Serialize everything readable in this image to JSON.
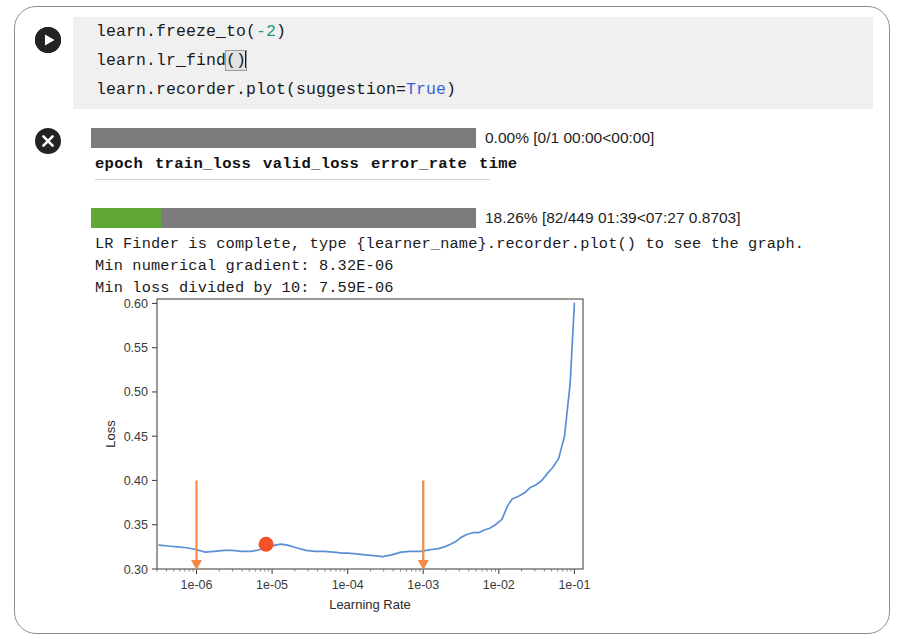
{
  "cell": {
    "run_icon": "play-icon",
    "stop_icon": "stop-close-icon",
    "code_lines": [
      {
        "pre": "learn.freeze_to(",
        "num": "-2",
        "post": ")"
      },
      {
        "pre": "learn.lr_find",
        "paren": "()",
        "post": ""
      },
      {
        "pre": "learn.recorder.plot(suggestion=",
        "kw": "True",
        "post": ")"
      }
    ]
  },
  "progress": {
    "epoch_bar": {
      "percent": 0,
      "percent_text": "0.00%",
      "detail": "[0/1 00:00<00:00]",
      "label": "0.00% [0/1 00:00<00:00]"
    },
    "batch_bar": {
      "percent": 18.26,
      "percent_text": "18.26%",
      "detail": "[82/449 01:39<07:27 0.8703]",
      "label": "18.26% [82/449 01:39<07:27 0.8703]"
    },
    "bar_bg_color": "#7c7c7c",
    "bar_fill_color": "#5fa834"
  },
  "metrics_table": {
    "columns": [
      "epoch",
      "train_loss",
      "valid_loss",
      "error_rate",
      "time"
    ],
    "rows": []
  },
  "terminal_output": [
    "LR Finder is complete, type {learner_name}.recorder.plot() to see the graph.",
    "Min numerical gradient: 8.32E-06",
    "Min loss divided by 10: 7.59E-06"
  ],
  "chart_data": {
    "type": "line",
    "title": "",
    "xlabel": "Learning Rate",
    "ylabel": "Loss",
    "xscale": "log",
    "xlim": [
      3e-07,
      0.13
    ],
    "ylim": [
      0.3,
      0.605
    ],
    "xticks": [
      1e-06,
      1e-05,
      0.0001,
      0.001,
      0.01,
      0.1
    ],
    "xtick_labels": [
      "1e-06",
      "1e-05",
      "1e-04",
      "1e-03",
      "1e-02",
      "1e-01"
    ],
    "yticks": [
      0.3,
      0.35,
      0.4,
      0.45,
      0.5,
      0.55,
      0.6
    ],
    "ytick_labels": [
      "0.30",
      "0.35",
      "0.40",
      "0.45",
      "0.50",
      "0.55",
      "0.60"
    ],
    "grid": false,
    "legend": null,
    "line_color": "#5b8fd4",
    "series": [
      {
        "name": "loss",
        "x": [
          3.2e-07,
          4.2e-07,
          5.6e-07,
          7.4e-07,
          9.8e-07,
          1.3e-06,
          1.7e-06,
          2.3e-06,
          3e-06,
          4e-06,
          5.3e-06,
          7e-06,
          9.3e-06,
          1.1e-05,
          1.3e-05,
          1.6e-05,
          2.1e-05,
          2.8e-05,
          3.7e-05,
          4.9e-05,
          6.5e-05,
          8.6e-05,
          0.0001,
          0.00013,
          0.00017,
          0.00022,
          0.00029,
          0.00038,
          0.00051,
          0.00067,
          0.0008,
          0.00093,
          0.0011,
          0.0013,
          0.0016,
          0.0019,
          0.0023,
          0.0027,
          0.0032,
          0.0038,
          0.0045,
          0.0054,
          0.0064,
          0.0076,
          0.009,
          0.011,
          0.013,
          0.015,
          0.018,
          0.022,
          0.026,
          0.031,
          0.037,
          0.044,
          0.052,
          0.062,
          0.074,
          0.088,
          0.1
        ],
        "y": [
          0.327,
          0.326,
          0.325,
          0.324,
          0.322,
          0.319,
          0.32,
          0.321,
          0.321,
          0.32,
          0.32,
          0.322,
          0.325,
          0.327,
          0.328,
          0.327,
          0.324,
          0.321,
          0.32,
          0.32,
          0.319,
          0.318,
          0.318,
          0.317,
          0.316,
          0.315,
          0.314,
          0.316,
          0.319,
          0.32,
          0.32,
          0.32,
          0.321,
          0.322,
          0.323,
          0.325,
          0.328,
          0.331,
          0.336,
          0.339,
          0.341,
          0.341,
          0.344,
          0.346,
          0.35,
          0.356,
          0.371,
          0.379,
          0.382,
          0.386,
          0.392,
          0.395,
          0.4,
          0.408,
          0.415,
          0.425,
          0.45,
          0.51,
          0.6
        ]
      }
    ],
    "annotations": {
      "suggestion_point": {
        "name": "min-gradient-marker",
        "x": 8.32e-06,
        "y": 0.328,
        "color": "#f4502a",
        "shape": "circle"
      },
      "arrows": [
        {
          "name": "arrow-min-gradient",
          "x": 1e-06,
          "y_from": 0.4,
          "y_to": 0.3,
          "color": "#f58a42"
        },
        {
          "name": "arrow-max-lr",
          "x": 0.001,
          "y_from": 0.4,
          "y_to": 0.3,
          "color": "#f58a42"
        }
      ]
    }
  }
}
